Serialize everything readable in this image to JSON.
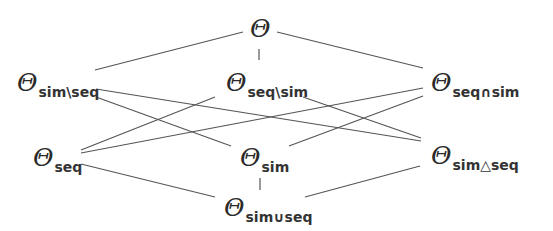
{
  "diagram": {
    "type": "lattice",
    "line_color": "#555555",
    "text_color": "#2a2a2a",
    "nodes": [
      {
        "id": "top",
        "symbol": "Θ",
        "subscript": ""
      },
      {
        "id": "sim_minus_seq",
        "symbol": "Θ",
        "subscript": "sim\\seq"
      },
      {
        "id": "seq_minus_sim",
        "symbol": "Θ",
        "subscript": "seq\\sim"
      },
      {
        "id": "seq_cap_sim",
        "symbol": "Θ",
        "subscript": "seq∩sim"
      },
      {
        "id": "seq",
        "symbol": "Θ",
        "subscript": "seq"
      },
      {
        "id": "sim",
        "symbol": "Θ",
        "subscript": "sim"
      },
      {
        "id": "sim_symdiff_seq",
        "symbol": "Θ",
        "subscript": "sim△seq"
      },
      {
        "id": "sim_cup_seq",
        "symbol": "Θ",
        "subscript": "sim∪seq"
      }
    ],
    "edges": [
      [
        "top",
        "sim_minus_seq"
      ],
      [
        "top",
        "seq_minus_sim"
      ],
      [
        "top",
        "seq_cap_sim"
      ],
      [
        "sim_minus_seq",
        "sim_symdiff_seq"
      ],
      [
        "sim_minus_seq",
        "sim"
      ],
      [
        "seq_minus_sim",
        "seq"
      ],
      [
        "seq_minus_sim",
        "sim_symdiff_seq"
      ],
      [
        "seq_cap_sim",
        "seq"
      ],
      [
        "seq_cap_sim",
        "sim"
      ],
      [
        "seq",
        "sim_cup_seq"
      ],
      [
        "sim",
        "sim_cup_seq"
      ],
      [
        "sim_symdiff_seq",
        "sim_cup_seq"
      ]
    ]
  }
}
